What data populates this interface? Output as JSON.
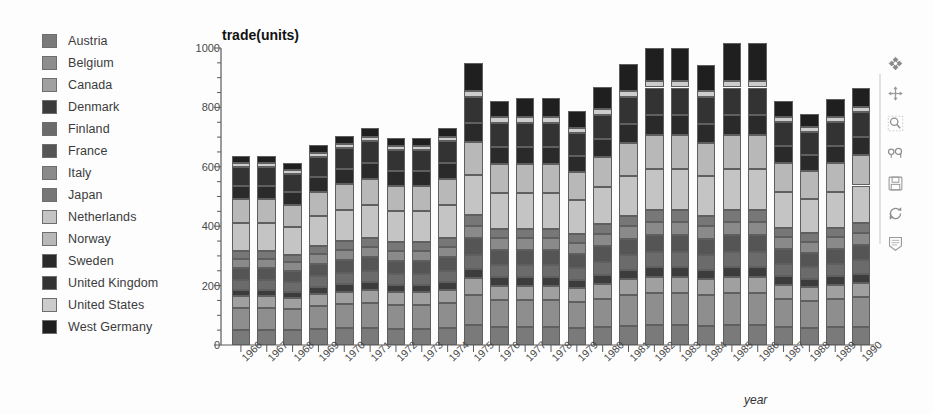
{
  "chart_data": {
    "type": "bar",
    "subtype": "stacked-bar",
    "title": "trade(units)",
    "xlabel": "year",
    "ylabel": "trade(units)",
    "ylim": [
      0,
      1000
    ],
    "ytick_values": [
      0,
      200,
      400,
      600,
      800,
      1000
    ],
    "ytick_labels": [
      "0",
      "200",
      "400",
      "600",
      "800",
      "1000"
    ],
    "yminor_step": 50,
    "grid": false,
    "legend_position": "left",
    "categories": [
      "1966",
      "1967",
      "1968",
      "1969",
      "1970",
      "1971",
      "1972",
      "1973",
      "1974",
      "1975",
      "1976",
      "1977",
      "1978",
      "1979",
      "1980",
      "1981",
      "1982",
      "1983",
      "1984",
      "1985",
      "1986",
      "1987",
      "1988",
      "1989",
      "1990"
    ],
    "series": [
      {
        "name": "Austria",
        "color": "#7a7a7a",
        "values": [
          52,
          52,
          50,
          54,
          56,
          57,
          55,
          55,
          57,
          66,
          60,
          60,
          60,
          58,
          60,
          64,
          66,
          66,
          64,
          66,
          66,
          60,
          58,
          60,
          62
        ]
      },
      {
        "name": "Belgium",
        "color": "#8e8e8e",
        "values": [
          74,
          74,
          72,
          78,
          82,
          84,
          80,
          80,
          84,
          104,
          92,
          92,
          92,
          88,
          96,
          104,
          108,
          108,
          104,
          108,
          108,
          94,
          90,
          94,
          98
        ]
      },
      {
        "name": "Canada",
        "color": "#a0a0a0",
        "values": [
          38,
          38,
          36,
          40,
          42,
          44,
          42,
          42,
          44,
          54,
          48,
          48,
          48,
          46,
          50,
          54,
          56,
          56,
          54,
          56,
          56,
          48,
          46,
          48,
          50
        ]
      },
      {
        "name": "Denmark",
        "color": "#3c3c3c",
        "values": [
          22,
          22,
          21,
          24,
          25,
          26,
          25,
          25,
          26,
          32,
          28,
          28,
          28,
          27,
          30,
          32,
          33,
          33,
          32,
          33,
          33,
          29,
          27,
          29,
          30
        ]
      },
      {
        "name": "Finland",
        "color": "#6b6b6b",
        "values": [
          34,
          34,
          33,
          36,
          38,
          39,
          38,
          38,
          39,
          48,
          43,
          43,
          43,
          41,
          45,
          48,
          50,
          50,
          48,
          50,
          50,
          43,
          41,
          43,
          45
        ]
      },
      {
        "name": "France",
        "color": "#555555",
        "values": [
          40,
          40,
          38,
          42,
          44,
          46,
          44,
          44,
          46,
          56,
          50,
          50,
          50,
          48,
          52,
          56,
          58,
          58,
          56,
          58,
          58,
          50,
          48,
          50,
          52
        ]
      },
      {
        "name": "Italy",
        "color": "#8a8a8a",
        "values": [
          30,
          30,
          29,
          32,
          33,
          34,
          33,
          33,
          34,
          42,
          38,
          38,
          38,
          36,
          40,
          42,
          44,
          44,
          42,
          44,
          44,
          38,
          36,
          38,
          40
        ]
      },
      {
        "name": "Japan",
        "color": "#777777",
        "values": [
          26,
          26,
          25,
          28,
          29,
          30,
          29,
          29,
          30,
          36,
          33,
          33,
          33,
          31,
          34,
          36,
          38,
          38,
          36,
          38,
          38,
          33,
          31,
          33,
          34
        ]
      },
      {
        "name": "Netherlands",
        "color": "#c4c4c4",
        "values": [
          96,
          96,
          92,
          100,
          106,
          110,
          104,
          104,
          110,
          134,
          120,
          120,
          120,
          114,
          124,
          134,
          140,
          140,
          134,
          140,
          140,
          120,
          114,
          120,
          126
        ]
      },
      {
        "name": "Norway",
        "color": "#b8b8b8",
        "values": [
          78,
          78,
          75,
          82,
          86,
          90,
          85,
          85,
          90,
          110,
          98,
          98,
          98,
          94,
          102,
          110,
          114,
          114,
          110,
          114,
          114,
          98,
          94,
          98,
          102
        ]
      },
      {
        "name": "Sweden",
        "color": "#2a2a2a",
        "values": [
          46,
          46,
          44,
          48,
          50,
          52,
          50,
          50,
          52,
          64,
          57,
          57,
          57,
          54,
          59,
          64,
          66,
          66,
          64,
          66,
          66,
          57,
          54,
          57,
          60
        ]
      },
      {
        "name": "United Kingdom",
        "color": "#333333",
        "values": [
          64,
          64,
          62,
          68,
          71,
          74,
          70,
          70,
          74,
          90,
          81,
          81,
          81,
          77,
          84,
          90,
          94,
          94,
          90,
          94,
          94,
          81,
          77,
          81,
          85
        ]
      },
      {
        "name": "United States",
        "color": "#cccccc",
        "values": [
          14,
          14,
          13,
          15,
          16,
          16,
          15,
          15,
          16,
          20,
          18,
          18,
          18,
          17,
          19,
          20,
          21,
          21,
          20,
          21,
          21,
          18,
          17,
          18,
          19
        ]
      },
      {
        "name": "West Germany",
        "color": "#1f1f1f",
        "values": [
          24,
          24,
          23,
          26,
          27,
          28,
          27,
          27,
          28,
          94,
          56,
          64,
          64,
          58,
          74,
          92,
          112,
          112,
          88,
          130,
          130,
          54,
          46,
          58,
          64
        ]
      }
    ],
    "totals": [
      638,
      638,
      613,
      673,
      705,
      690,
      687,
      687,
      730,
      860,
      822,
      805,
      810,
      728,
      845,
      900,
      910,
      905,
      870,
      928,
      928,
      815,
      800,
      825,
      865
    ]
  },
  "legend": {
    "items": [
      {
        "label": "Austria"
      },
      {
        "label": "Belgium"
      },
      {
        "label": "Canada"
      },
      {
        "label": "Denmark"
      },
      {
        "label": "Finland"
      },
      {
        "label": "France"
      },
      {
        "label": "Italy"
      },
      {
        "label": "Japan"
      },
      {
        "label": "Netherlands"
      },
      {
        "label": "Norway"
      },
      {
        "label": "Sweden"
      },
      {
        "label": "United Kingdom"
      },
      {
        "label": "United States"
      },
      {
        "label": "West Germany"
      }
    ]
  },
  "toolbar": {
    "items": [
      {
        "name": "orbit-icon",
        "tooltip": "Rotate"
      },
      {
        "name": "pan-icon",
        "tooltip": "Pan"
      },
      {
        "name": "zoom-select-icon",
        "tooltip": "Zoom to selection"
      },
      {
        "name": "zoom-pair-icon",
        "tooltip": "Zoom"
      },
      {
        "name": "save-icon",
        "tooltip": "Save"
      },
      {
        "name": "refresh-icon",
        "tooltip": "Reset"
      },
      {
        "name": "notes-icon",
        "tooltip": "Notes"
      }
    ]
  },
  "colors": {
    "background": "#fdfdfd",
    "axis": "#5a5a5a",
    "text": "#3b3b3b",
    "bar_border": "#5f5f5f"
  }
}
